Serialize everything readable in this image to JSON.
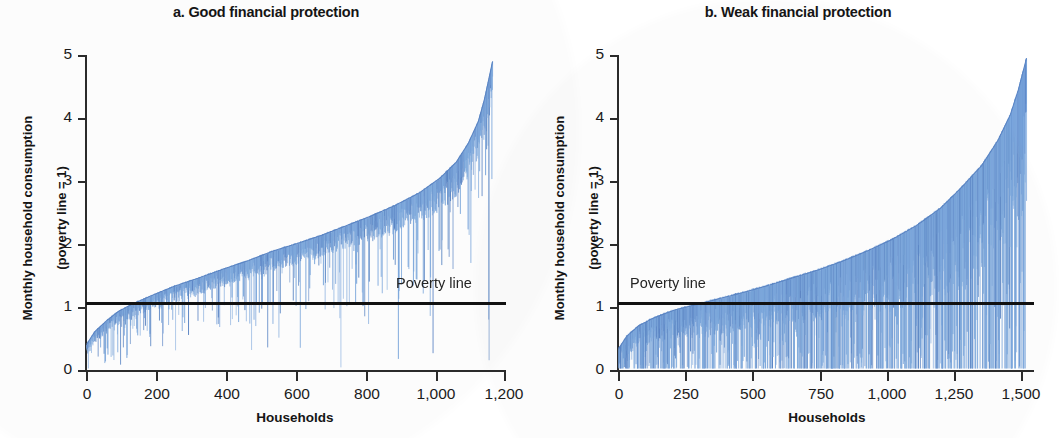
{
  "figure": {
    "background_color": "#ffffff",
    "series_color": "#7ba7dd",
    "series_color_dark": "#5b86c6",
    "axis_color": "#2b2b2b",
    "poverty_line_color": "#111111"
  },
  "panels": [
    {
      "id": "panel-a",
      "title": "a. Good financial protection",
      "ylabel_line1": "Monthly household consumption",
      "ylabel_line2": "(poverty line = 1)",
      "xlabel": "Households",
      "poverty_line_label": "Poverty line",
      "poverty_line_label_side": "right",
      "yticks": [
        "5",
        "4",
        "3",
        "2",
        "1",
        "0"
      ],
      "xticks": [
        "0",
        "200",
        "400",
        "600",
        "800",
        "1,000",
        "1,200"
      ]
    },
    {
      "id": "panel-b",
      "title": "b. Weak financial protection",
      "ylabel_line1": "Monthly household consumption",
      "ylabel_line2": "(poverty line = 1)",
      "xlabel": "Households",
      "poverty_line_label": "Poverty line",
      "poverty_line_label_side": "left",
      "yticks": [
        "5",
        "4",
        "3",
        "2",
        "1",
        "0"
      ],
      "xticks": [
        "0",
        "250",
        "500",
        "750",
        "1,000",
        "1,250",
        "1,500"
      ]
    }
  ],
  "chart_data": [
    {
      "type": "area",
      "panel": "a",
      "title": "a. Good financial protection",
      "xlabel": "Households",
      "ylabel": "Monthly household consumption (poverty line = 1)",
      "xlim": [
        0,
        1200
      ],
      "ylim": [
        0,
        5
      ],
      "xticks": [
        0,
        200,
        400,
        600,
        800,
        1000,
        1200
      ],
      "yticks": [
        0,
        1,
        2,
        3,
        4,
        5
      ],
      "grid": false,
      "legend": "none",
      "n_households": 1160,
      "annotations": [
        {
          "text": "Poverty line",
          "y": 1,
          "x": 880,
          "type": "hline-label"
        }
      ],
      "reference_lines": [
        {
          "name": "Poverty line",
          "y": 1,
          "color": "#111111"
        }
      ],
      "description": "Households ranked by monthly consumption (upper envelope); vertical blue drop-lines show consumption after out-of-pocket health payments. Few drops cross the poverty line.",
      "series": [
        {
          "name": "Consumption before health payments (upper envelope)",
          "x_fraction": [
            0.0,
            0.02,
            0.05,
            0.08,
            0.12,
            0.17,
            0.22,
            0.28,
            0.34,
            0.4,
            0.46,
            0.52,
            0.58,
            0.64,
            0.7,
            0.76,
            0.82,
            0.87,
            0.91,
            0.94,
            0.965,
            0.98,
            0.99,
            1.0
          ],
          "values": [
            0.42,
            0.62,
            0.8,
            0.95,
            1.08,
            1.22,
            1.35,
            1.48,
            1.62,
            1.75,
            1.9,
            2.02,
            2.15,
            2.3,
            2.45,
            2.62,
            2.82,
            3.05,
            3.3,
            3.6,
            3.95,
            4.3,
            4.6,
            4.9
          ]
        },
        {
          "name": "Drop-line depth (typical, consumption units)",
          "x_fraction": [
            0.0,
            0.1,
            0.2,
            0.3,
            0.4,
            0.5,
            0.6,
            0.7,
            0.8,
            0.9,
            1.0
          ],
          "values": [
            0.18,
            0.22,
            0.25,
            0.28,
            0.3,
            0.32,
            0.35,
            0.4,
            0.45,
            0.55,
            0.65
          ]
        }
      ],
      "households_impoverished_note": "drops below poverty line concentrated in the first ~15% of households"
    },
    {
      "type": "area",
      "panel": "b",
      "title": "b. Weak financial protection",
      "xlabel": "Households",
      "ylabel": "Monthly household consumption (poverty line = 1)",
      "xlim": [
        0,
        1550
      ],
      "ylim": [
        0,
        5
      ],
      "xticks": [
        0,
        250,
        500,
        750,
        1000,
        1250,
        1500
      ],
      "yticks": [
        0,
        1,
        2,
        3,
        4,
        5
      ],
      "grid": false,
      "legend": "none",
      "n_households": 1520,
      "annotations": [
        {
          "text": "Poverty line",
          "y": 1,
          "x": 150,
          "type": "hline-label"
        }
      ],
      "reference_lines": [
        {
          "name": "Poverty line",
          "y": 1,
          "color": "#111111"
        }
      ],
      "description": "Households ranked by monthly consumption; much longer and more frequent vertical drop-lines, many crossing the poverty line even for better-off households.",
      "series": [
        {
          "name": "Consumption before health payments (upper envelope)",
          "x_fraction": [
            0.0,
            0.02,
            0.05,
            0.09,
            0.14,
            0.19,
            0.25,
            0.31,
            0.37,
            0.43,
            0.49,
            0.55,
            0.61,
            0.67,
            0.73,
            0.79,
            0.84,
            0.89,
            0.93,
            0.96,
            0.98,
            0.99,
            1.0
          ],
          "values": [
            0.35,
            0.55,
            0.72,
            0.85,
            0.97,
            1.05,
            1.15,
            1.25,
            1.36,
            1.48,
            1.6,
            1.74,
            1.9,
            2.08,
            2.3,
            2.58,
            2.9,
            3.25,
            3.65,
            4.05,
            4.45,
            4.7,
            4.95
          ]
        },
        {
          "name": "Drop-line depth (typical, consumption units)",
          "x_fraction": [
            0.0,
            0.1,
            0.2,
            0.3,
            0.4,
            0.5,
            0.6,
            0.7,
            0.8,
            0.9,
            1.0
          ],
          "values": [
            0.3,
            0.4,
            0.5,
            0.6,
            0.7,
            0.85,
            1.0,
            1.2,
            1.45,
            1.8,
            2.3
          ]
        }
      ],
      "households_impoverished_note": "drops below poverty line occur across the whole distribution"
    }
  ]
}
